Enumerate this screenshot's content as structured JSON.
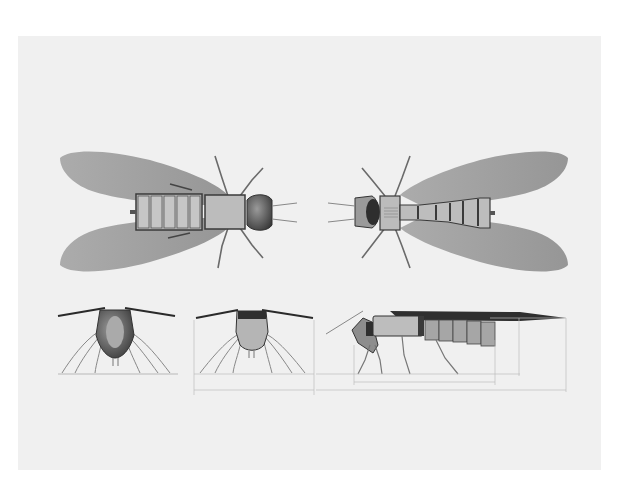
{
  "figure": {
    "background": "#ffffff",
    "panel_color": "#f0f0f0",
    "wing_color": "#9a9a9a",
    "body_color": "#a8a8a8",
    "outline_color": "#3a3a3a",
    "leg_color": "#6a6a6a",
    "dimension_color": "#b5b5b5"
  },
  "views": [
    {
      "id": "top",
      "label": "Top view"
    },
    {
      "id": "bottom",
      "label": "Bottom view"
    },
    {
      "id": "front",
      "label": "Front view"
    },
    {
      "id": "rear",
      "label": "Rear view"
    },
    {
      "id": "side",
      "label": "Side view"
    }
  ],
  "dimensions": {
    "rear_width": "",
    "side_body_length": "",
    "side_total_length": "",
    "side_height": ""
  }
}
